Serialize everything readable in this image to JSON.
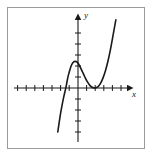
{
  "figure": {
    "kind": "cartesian-graph",
    "caption": "",
    "frame_color": "#9a9a9a",
    "background_color": "#ffffff",
    "curve_color": "#1a1a1a",
    "axis_color": "#1a1a1a"
  },
  "axes": {
    "x_label": "x",
    "y_label": "y",
    "origin_px": {
      "x": 78,
      "y": 88
    },
    "x_tick_spacing_px": 8.6,
    "y_tick_spacing_px": 11.0,
    "x_axis_start_px": 14,
    "x_axis_end_px": 131,
    "y_axis_top_px": 16,
    "y_axis_bottom_px": 142,
    "x_ticks_left_of_origin": 7,
    "x_ticks_right_of_origin": 5,
    "y_ticks_above_origin": 6,
    "y_ticks_below_origin": 4,
    "arrowheads": [
      "x-positive",
      "y-positive"
    ],
    "grid": "off",
    "tick_labels": "none"
  },
  "chart_data": {
    "type": "line",
    "title": "",
    "xlabel": "x",
    "ylabel": "y",
    "xlim": [
      -7,
      5
    ],
    "ylim": [
      -4,
      6
    ],
    "grid": false,
    "legend": "none",
    "annotations": [],
    "series": [
      {
        "name": "cubic",
        "description": "Cubic with a simple root near x = -1.5 and a double root (tangent to x-axis) near x = 2",
        "roots": [
          -1.5,
          2,
          2
        ],
        "local_maximum": {
          "x": -0.35,
          "y": 2.4
        },
        "local_minimum": {
          "x": 2.0,
          "y": 0.0
        },
        "x": [
          -2.35,
          -2.2,
          -2.0,
          -1.8,
          -1.6,
          -1.4,
          -1.2,
          -1.0,
          -0.8,
          -0.6,
          -0.35,
          -0.1,
          0.2,
          0.5,
          0.8,
          1.1,
          1.4,
          1.7,
          2.0,
          2.3,
          2.6,
          2.9,
          3.2,
          3.5,
          3.8,
          4.1,
          4.4
        ],
        "y": [
          -4.0,
          -3.2,
          -2.2,
          -1.35,
          -0.6,
          0.05,
          0.9,
          1.5,
          2.0,
          2.3,
          2.42,
          2.35,
          2.0,
          1.5,
          1.0,
          0.55,
          0.22,
          0.05,
          0.0,
          0.1,
          0.4,
          0.9,
          1.6,
          2.5,
          3.6,
          4.9,
          6.2
        ]
      }
    ]
  }
}
